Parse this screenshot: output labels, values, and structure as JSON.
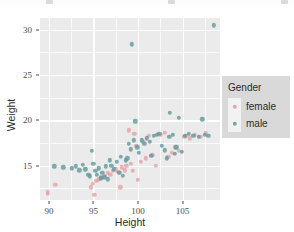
{
  "chart_data": {
    "type": "scatter",
    "title": "",
    "xlabel": "Height",
    "ylabel": "Weight",
    "xlim": [
      89.0,
      109.2
    ],
    "ylim": [
      11.2,
      31.3
    ],
    "xticks": [
      "90",
      "95",
      "100",
      "105"
    ],
    "xtick_values": [
      90,
      95,
      100,
      105
    ],
    "yticks": [
      "15",
      "20",
      "25",
      "30"
    ],
    "ytick_values": [
      15,
      20,
      25,
      30
    ],
    "grid": "major-and-minor-white-on-grey",
    "legend": {
      "title": "Gender",
      "position": "right",
      "entries": [
        {
          "label": "female",
          "color": "#e09aa0"
        },
        {
          "label": "male",
          "color": "#5f9a9b"
        }
      ]
    },
    "colors": {
      "panel_background": "#ebebeb",
      "grid_line": "#ffffff",
      "legend_background": "#d9d9d9",
      "legend_key_background": "#f2f2f2",
      "female": "#e09aa0",
      "male": "#5f9a9b",
      "axis_text": "#4d4d4d",
      "axis_title": "#2b2b2b"
    },
    "series": [
      {
        "name": "female",
        "points": [
          [
            89.9,
            11.9
          ],
          [
            89.9,
            12.1
          ],
          [
            90.7,
            12.9
          ],
          [
            94.7,
            12.6
          ],
          [
            94.9,
            13.0
          ],
          [
            95.1,
            11.8
          ],
          [
            95.3,
            13.3
          ],
          [
            95.6,
            13.5
          ],
          [
            95.9,
            13.7
          ],
          [
            96.3,
            13.9
          ],
          [
            96.6,
            14.2
          ],
          [
            96.9,
            14.0
          ],
          [
            97.2,
            14.4
          ],
          [
            97.5,
            14.6
          ],
          [
            97.8,
            14.3
          ],
          [
            98.0,
            12.6
          ],
          [
            98.2,
            14.8
          ],
          [
            98.5,
            14.5
          ],
          [
            98.7,
            15.0
          ],
          [
            99.0,
            18.9
          ],
          [
            99.2,
            15.2
          ],
          [
            99.4,
            14.4
          ],
          [
            99.6,
            18.5
          ],
          [
            99.8,
            17.2
          ],
          [
            100.0,
            13.4
          ],
          [
            100.3,
            15.4
          ],
          [
            100.6,
            17.6
          ],
          [
            100.9,
            15.8
          ],
          [
            101.2,
            18.3
          ],
          [
            101.6,
            16.2
          ],
          [
            102.0,
            15.0
          ],
          [
            102.5,
            18.4
          ],
          [
            103.0,
            18.6
          ],
          [
            103.4,
            16.0
          ],
          [
            103.8,
            16.4
          ],
          [
            104.2,
            17.0
          ],
          [
            104.6,
            16.6
          ],
          [
            105.2,
            18.2
          ],
          [
            105.8,
            18.0
          ],
          [
            106.4,
            18.4
          ],
          [
            107.0,
            18.2
          ],
          [
            107.6,
            18.6
          ]
        ]
      },
      {
        "name": "male",
        "points": [
          [
            90.6,
            14.9
          ],
          [
            91.6,
            14.8
          ],
          [
            92.6,
            14.7
          ],
          [
            93.0,
            14.9
          ],
          [
            93.4,
            14.5
          ],
          [
            93.8,
            15.1
          ],
          [
            94.1,
            14.6
          ],
          [
            94.4,
            14.0
          ],
          [
            94.6,
            13.8
          ],
          [
            94.8,
            16.6
          ],
          [
            95.0,
            15.2
          ],
          [
            95.2,
            14.4
          ],
          [
            95.4,
            14.0
          ],
          [
            95.6,
            14.7
          ],
          [
            95.8,
            13.6
          ],
          [
            96.0,
            14.2
          ],
          [
            96.2,
            13.7
          ],
          [
            96.4,
            14.9
          ],
          [
            96.6,
            13.5
          ],
          [
            96.8,
            15.6
          ],
          [
            97.0,
            15.0
          ],
          [
            97.3,
            14.6
          ],
          [
            97.6,
            15.4
          ],
          [
            97.9,
            14.2
          ],
          [
            98.1,
            16.0
          ],
          [
            98.3,
            13.9
          ],
          [
            98.6,
            15.6
          ],
          [
            98.8,
            15.8
          ],
          [
            99.0,
            17.4
          ],
          [
            99.2,
            16.8
          ],
          [
            99.3,
            28.4
          ],
          [
            99.5,
            17.8
          ],
          [
            99.7,
            19.9
          ],
          [
            99.9,
            17.0
          ],
          [
            100.1,
            16.4
          ],
          [
            100.4,
            17.8
          ],
          [
            100.7,
            17.4
          ],
          [
            101.0,
            18.0
          ],
          [
            101.3,
            17.6
          ],
          [
            101.5,
            16.1
          ],
          [
            101.8,
            18.3
          ],
          [
            102.1,
            18.4
          ],
          [
            102.4,
            18.5
          ],
          [
            102.7,
            17.2
          ],
          [
            103.0,
            16.7
          ],
          [
            103.2,
            15.8
          ],
          [
            103.5,
            18.2
          ],
          [
            103.6,
            20.8
          ],
          [
            103.9,
            18.4
          ],
          [
            104.1,
            16.3
          ],
          [
            104.3,
            17.0
          ],
          [
            104.6,
            20.3
          ],
          [
            104.9,
            16.5
          ],
          [
            105.3,
            18.3
          ],
          [
            105.7,
            18.5
          ],
          [
            106.2,
            18.3
          ],
          [
            106.8,
            18.2
          ],
          [
            107.2,
            20.1
          ],
          [
            107.5,
            18.4
          ],
          [
            107.9,
            18.3
          ],
          [
            108.5,
            30.5
          ]
        ]
      }
    ]
  }
}
